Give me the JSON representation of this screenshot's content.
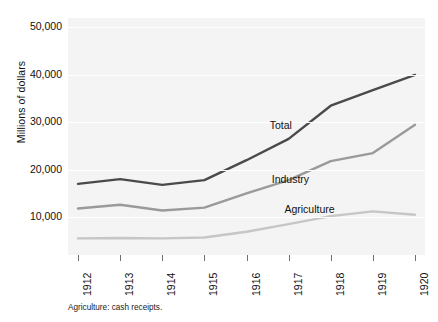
{
  "chart_data": {
    "type": "line",
    "title": "",
    "xlabel": "",
    "ylabel": "Millions of dollars",
    "x": [
      1912,
      1913,
      1914,
      1915,
      1916,
      1917,
      1918,
      1919,
      1920
    ],
    "xtick_labels": [
      "1912",
      "1913",
      "1914",
      "1915",
      "1916",
      "1917",
      "1918",
      "1919",
      "1920"
    ],
    "ytick_labels": [
      "50,000",
      "40,000",
      "30,000",
      "20,000",
      "10,000"
    ],
    "ytick_values": [
      50000,
      40000,
      30000,
      20000,
      10000
    ],
    "ylim": [
      2000,
      52000
    ],
    "xlim": [
      1912,
      1920
    ],
    "grid": true,
    "legend": "inline-labels",
    "series": [
      {
        "name": "Total",
        "color": "#4a4a4a",
        "values": [
          17000,
          18000,
          16800,
          17800,
          22000,
          26500,
          33500,
          36800,
          40000
        ],
        "label_x": 1916.55,
        "label_y": 29200
      },
      {
        "name": "Industry",
        "color": "#9a9a9a",
        "values": [
          11800,
          12600,
          11400,
          12000,
          15000,
          17800,
          21800,
          23500,
          29500
        ],
        "label_x": 1916.6,
        "label_y": 17800
      },
      {
        "name": "Agriculture",
        "color": "#c6c6c6",
        "values": [
          5500,
          5600,
          5500,
          5700,
          6900,
          8500,
          10200,
          11200,
          10500
        ],
        "label_x": 1916.9,
        "label_y": 11400
      }
    ]
  },
  "caption": "Agriculture: cash receipts.",
  "colors": {
    "plot_background": "#f4f4f4",
    "gridline": "#ffffff",
    "text": "#111111",
    "tick": "#6f6f6f"
  }
}
